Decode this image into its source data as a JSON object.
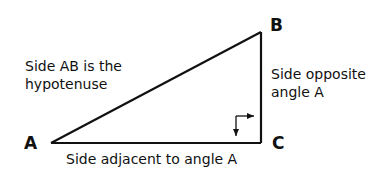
{
  "diagram": {
    "type": "right-triangle",
    "vertices": {
      "A": {
        "label": "A",
        "x": 51,
        "y": 143
      },
      "B": {
        "label": "B",
        "x": 261,
        "y": 32
      },
      "C": {
        "label": "C",
        "x": 261,
        "y": 143
      }
    },
    "annotations": {
      "hypotenuse_line1": "Side AB is the",
      "hypotenuse_line2": "hypotenuse",
      "opposite_line1": "Side opposite",
      "opposite_line2": "angle A",
      "adjacent": "Side adjacent to angle A"
    },
    "right_angle_marker": {
      "at": "C"
    },
    "colors": {
      "stroke": "#111111",
      "background": "#ffffff"
    }
  }
}
